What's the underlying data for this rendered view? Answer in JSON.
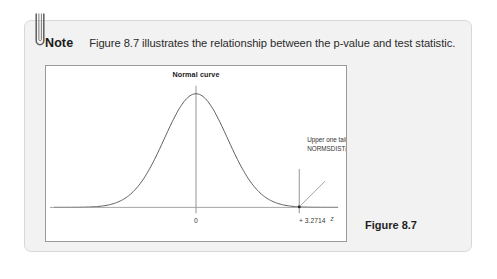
{
  "note": {
    "label": "Note",
    "body": "Figure 8.7 illustrates the relationship between the p-value and test statistic.",
    "clip_icon": "paperclip-icon"
  },
  "figure": {
    "caption": "Figure 8.7"
  },
  "chart_data": {
    "type": "line",
    "title": "Normal curve",
    "xlabel": "z",
    "ylabel": "",
    "xlim": [
      -4.5,
      4.5
    ],
    "ylim": [
      0,
      0.42
    ],
    "grid": false,
    "legend": null,
    "series": [
      {
        "name": "Standard normal density",
        "x": [
          -4.5,
          -4.0,
          -3.5,
          -3.0,
          -2.5,
          -2.0,
          -1.5,
          -1.0,
          -0.5,
          0.0,
          0.5,
          1.0,
          1.5,
          2.0,
          2.5,
          3.0,
          3.2714,
          3.5,
          4.0,
          4.5
        ],
        "y": [
          0.0,
          0.0001,
          0.0009,
          0.0044,
          0.0175,
          0.054,
          0.1295,
          0.242,
          0.3521,
          0.3989,
          0.3521,
          0.242,
          0.1295,
          0.054,
          0.0175,
          0.0044,
          0.0019,
          0.0009,
          0.0001,
          0.0
        ]
      }
    ],
    "xticks": [
      0,
      3.2714
    ],
    "xtick_labels": [
      "0",
      "+ 3.2714"
    ],
    "vlines": [
      {
        "x": 0,
        "label": "mean-line"
      },
      {
        "x": 3.2714,
        "label": "test-statistic-line"
      }
    ],
    "marker": {
      "x": 3.2714,
      "y": 0.0019,
      "shape": "square"
    },
    "annotations": [
      {
        "name": "upper-tail-annotation",
        "line1": "Upper one tail p = 1-",
        "line2": "NORMSDIST(3.2714)",
        "points_to_x": 3.2714
      }
    ]
  }
}
